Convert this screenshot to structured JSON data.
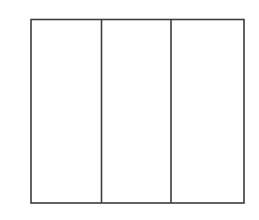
{
  "figure": {
    "name": "three-panel-rectangular-frame",
    "background_color": "#ffffff",
    "stroke_color": "#3d3d3d",
    "fill_color": "#ffffff",
    "stroke_width": 1.6,
    "canvas": {
      "width": 259,
      "height": 220
    },
    "outer_frame": {
      "x": 31,
      "y": 19.5,
      "width": 213,
      "height": 183.5
    },
    "dividers": [
      {
        "name": "divider-1",
        "x": 101.5
      },
      {
        "name": "divider-2",
        "x": 171
      }
    ],
    "panels": [
      {
        "name": "panel-left",
        "label": "",
        "x": 31,
        "width": 70.5
      },
      {
        "name": "panel-center",
        "label": "",
        "x": 101.5,
        "width": 69.5
      },
      {
        "name": "panel-right",
        "label": "",
        "x": 171,
        "width": 73
      }
    ]
  }
}
